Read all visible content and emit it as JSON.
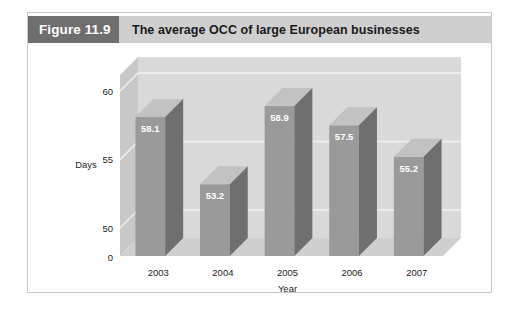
{
  "figure": {
    "number_label": "Figure 11.9",
    "title": "The average OCC of large European businesses"
  },
  "colors": {
    "header_number_bg": "#6e6e6e",
    "header_title_bg": "#cfcfcf",
    "bar_front": "#9a9a9a",
    "bar_top": "#c2c2c2",
    "bar_side": "#6f6f6f",
    "plot_back_wall": "#d9d9d9",
    "plot_floor": "#cfcfcf",
    "gridline": "#f2f2f2",
    "border": "#c9c9c9"
  },
  "chart_data": {
    "type": "bar",
    "title": "The average OCC of large European businesses",
    "categories": [
      "2003",
      "2004",
      "2005",
      "2006",
      "2007"
    ],
    "values": [
      58.1,
      53.2,
      58.9,
      57.5,
      55.2
    ],
    "value_labels": [
      "58.1",
      "53.2",
      "58.9",
      "57.5",
      "55.2"
    ],
    "xlabel": "Year",
    "ylabel": "Days",
    "ytick_labels": [
      "0",
      "50",
      "55",
      "60"
    ],
    "ytick_values": [
      0,
      50,
      55,
      60
    ],
    "ylim": [
      0,
      60
    ],
    "grid": true,
    "legend": "none",
    "three_d": true
  }
}
